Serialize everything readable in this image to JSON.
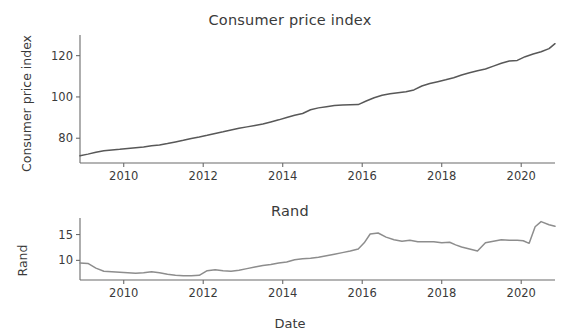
{
  "figure": {
    "xlabel": "Date",
    "background": "#ffffff",
    "axis_color": "#6b6b6b"
  },
  "chart_data": [
    {
      "type": "line",
      "title": "Consumer price index",
      "xlabel": "",
      "ylabel": "Consumer price index",
      "grid": false,
      "legend": "none",
      "line_color": "#585858",
      "xlim": [
        2008.9,
        2020.85
      ],
      "ylim": [
        68,
        130
      ],
      "xticks": [
        2010,
        2012,
        2014,
        2016,
        2018,
        2020
      ],
      "xticklabels": [
        "2010",
        "2012",
        "2014",
        "2016",
        "2018",
        "2020"
      ],
      "yticks": [
        80,
        100,
        120
      ],
      "yticklabels": [
        "80",
        "100",
        "120"
      ],
      "x": [
        2008.9,
        2009.1,
        2009.3,
        2009.5,
        2009.7,
        2009.9,
        2010.1,
        2010.3,
        2010.5,
        2010.7,
        2010.9,
        2011.1,
        2011.3,
        2011.5,
        2011.7,
        2011.9,
        2012.1,
        2012.3,
        2012.5,
        2012.7,
        2012.9,
        2013.1,
        2013.3,
        2013.5,
        2013.7,
        2013.9,
        2014.1,
        2014.3,
        2014.5,
        2014.7,
        2014.9,
        2015.1,
        2015.3,
        2015.5,
        2015.7,
        2015.9,
        2016.1,
        2016.3,
        2016.5,
        2016.7,
        2016.9,
        2017.1,
        2017.3,
        2017.5,
        2017.7,
        2017.9,
        2018.1,
        2018.3,
        2018.5,
        2018.7,
        2018.9,
        2019.1,
        2019.3,
        2019.5,
        2019.7,
        2019.9,
        2020.1,
        2020.3,
        2020.5,
        2020.7,
        2020.85
      ],
      "y": [
        71.5,
        72.3,
        73.2,
        73.9,
        74.3,
        74.6,
        75.0,
        75.4,
        75.8,
        76.3,
        76.7,
        77.4,
        78.2,
        79.0,
        79.9,
        80.6,
        81.4,
        82.3,
        83.1,
        84.0,
        84.8,
        85.5,
        86.2,
        86.9,
        87.9,
        88.9,
        90.0,
        91.1,
        92.0,
        93.8,
        94.7,
        95.3,
        95.8,
        96.1,
        96.2,
        96.3,
        98.0,
        99.6,
        100.8,
        101.5,
        102.0,
        102.5,
        103.4,
        105.3,
        106.5,
        107.4,
        108.3,
        109.3,
        110.6,
        111.7,
        112.7,
        113.5,
        114.9,
        116.3,
        117.4,
        117.7,
        119.5,
        120.8,
        121.9,
        123.4,
        125.8
      ],
      "series_name": "Consumer price index"
    },
    {
      "type": "line",
      "title": "Rand",
      "xlabel": "Date",
      "ylabel": "Rand",
      "grid": false,
      "legend": "none",
      "line_color": "#8d8d8d",
      "xlim": [
        2008.9,
        2020.85
      ],
      "ylim": [
        6.2,
        18.2
      ],
      "xticks": [
        2010,
        2012,
        2014,
        2016,
        2018,
        2020
      ],
      "xticklabels": [
        "2010",
        "2012",
        "2014",
        "2016",
        "2018",
        "2020"
      ],
      "yticks": [
        10,
        15
      ],
      "yticklabels": [
        "10",
        "15"
      ],
      "x": [
        2008.9,
        2009.1,
        2009.3,
        2009.5,
        2009.7,
        2009.9,
        2010.1,
        2010.3,
        2010.5,
        2010.7,
        2010.9,
        2011.1,
        2011.3,
        2011.5,
        2011.7,
        2011.9,
        2012.1,
        2012.3,
        2012.5,
        2012.7,
        2012.9,
        2013.1,
        2013.3,
        2013.5,
        2013.7,
        2013.9,
        2014.1,
        2014.3,
        2014.5,
        2014.7,
        2014.9,
        2015.1,
        2015.3,
        2015.5,
        2015.7,
        2015.9,
        2016.05,
        2016.2,
        2016.4,
        2016.6,
        2016.8,
        2017.0,
        2017.2,
        2017.4,
        2017.6,
        2017.8,
        2018.0,
        2018.2,
        2018.35,
        2018.5,
        2018.7,
        2018.9,
        2019.1,
        2019.3,
        2019.5,
        2019.7,
        2019.9,
        2020.05,
        2020.2,
        2020.35,
        2020.5,
        2020.7,
        2020.85
      ],
      "y": [
        9.5,
        9.4,
        8.5,
        7.9,
        7.8,
        7.7,
        7.6,
        7.5,
        7.6,
        7.8,
        7.6,
        7.3,
        7.1,
        7.0,
        7.0,
        7.1,
        8.0,
        8.2,
        8.0,
        7.9,
        8.1,
        8.4,
        8.7,
        9.0,
        9.2,
        9.5,
        9.7,
        10.1,
        10.3,
        10.4,
        10.6,
        10.9,
        11.2,
        11.5,
        11.8,
        12.2,
        13.4,
        15.1,
        15.3,
        14.5,
        14.0,
        13.7,
        13.9,
        13.6,
        13.6,
        13.6,
        13.4,
        13.5,
        13.0,
        12.6,
        12.2,
        11.8,
        13.4,
        13.7,
        14.0,
        13.9,
        13.9,
        13.8,
        13.3,
        16.5,
        17.5,
        16.9,
        16.6
      ],
      "series_name": "Rand"
    }
  ]
}
